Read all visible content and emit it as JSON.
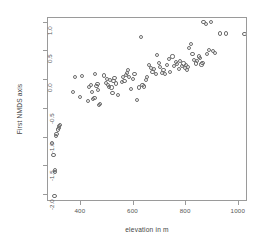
{
  "chart_data": {
    "type": "scatter",
    "title": "",
    "xlabel": "elevation in m",
    "ylabel": "First NMDS axis",
    "xlim": [
      275,
      1035
    ],
    "ylim": [
      -2.12,
      1.08
    ],
    "xticks": [
      400,
      600,
      800,
      1000
    ],
    "yticks": [
      1.0,
      0.5,
      0.0,
      -0.5,
      -1.0,
      -1.5,
      -2.0
    ],
    "xtick_labels": [
      "400",
      "600",
      "800",
      "1000"
    ],
    "ytick_labels": [
      "1.0",
      "0.5",
      "0.0",
      "-0.5",
      "-1.0",
      "-1.5",
      "-2.0"
    ],
    "grid": false,
    "legend": null,
    "marker": "open-circle",
    "marker_color": "#6d6d6d",
    "n_points": 101,
    "points": [
      [
        300,
        -2.01
      ],
      [
        302,
        -1.6
      ],
      [
        303,
        -1.57
      ],
      [
        296,
        -1.3
      ],
      [
        290,
        -1.09
      ],
      [
        305,
        -0.97
      ],
      [
        307,
        -0.94
      ],
      [
        312,
        -0.86
      ],
      [
        316,
        -0.83
      ],
      [
        318,
        -0.8
      ],
      [
        321,
        -0.78
      ],
      [
        370,
        -0.2
      ],
      [
        378,
        0.06
      ],
      [
        396,
        -0.29
      ],
      [
        404,
        0.07
      ],
      [
        428,
        -0.36
      ],
      [
        432,
        -0.12
      ],
      [
        437,
        -0.08
      ],
      [
        441,
        -0.2
      ],
      [
        447,
        -0.33
      ],
      [
        452,
        -0.31
      ],
      [
        455,
        0.11
      ],
      [
        459,
        -0.1
      ],
      [
        463,
        -0.07
      ],
      [
        466,
        -0.17
      ],
      [
        470,
        -0.44
      ],
      [
        474,
        -0.41
      ],
      [
        487,
        0.08
      ],
      [
        496,
        -0.05
      ],
      [
        500,
        0.02
      ],
      [
        504,
        -0.09
      ],
      [
        508,
        -0.12
      ],
      [
        512,
        0.0
      ],
      [
        516,
        -0.13
      ],
      [
        520,
        -0.23
      ],
      [
        524,
        -0.02
      ],
      [
        528,
        0.04
      ],
      [
        533,
        -0.06
      ],
      [
        541,
        -0.26
      ],
      [
        556,
        -0.04
      ],
      [
        560,
        0.05
      ],
      [
        566,
        -0.02
      ],
      [
        571,
        0.09
      ],
      [
        576,
        0.13
      ],
      [
        580,
        0.18
      ],
      [
        584,
        0.05
      ],
      [
        590,
        -0.15
      ],
      [
        597,
        0.02
      ],
      [
        604,
        0.1
      ],
      [
        612,
        -0.35
      ],
      [
        620,
        -0.13
      ],
      [
        628,
        0.75
      ],
      [
        634,
        -0.09
      ],
      [
        640,
        -0.11
      ],
      [
        646,
        0.0
      ],
      [
        652,
        0.06
      ],
      [
        660,
        0.26
      ],
      [
        666,
        0.21
      ],
      [
        672,
        0.14
      ],
      [
        678,
        0.19
      ],
      [
        684,
        0.11
      ],
      [
        690,
        0.44
      ],
      [
        696,
        0.3
      ],
      [
        702,
        0.23
      ],
      [
        708,
        0.13
      ],
      [
        714,
        0.18
      ],
      [
        720,
        0.1
      ],
      [
        728,
        0.26
      ],
      [
        734,
        0.37
      ],
      [
        740,
        0.14
      ],
      [
        748,
        0.41
      ],
      [
        754,
        0.25
      ],
      [
        760,
        0.31
      ],
      [
        766,
        0.28
      ],
      [
        772,
        0.2
      ],
      [
        778,
        0.33
      ],
      [
        784,
        0.24
      ],
      [
        790,
        0.29
      ],
      [
        796,
        0.21
      ],
      [
        800,
        0.26
      ],
      [
        804,
        0.18
      ],
      [
        808,
        0.23
      ],
      [
        812,
        0.56
      ],
      [
        818,
        0.63
      ],
      [
        824,
        0.46
      ],
      [
        830,
        0.35
      ],
      [
        836,
        0.29
      ],
      [
        842,
        0.33
      ],
      [
        848,
        0.41
      ],
      [
        854,
        0.38
      ],
      [
        858,
        0.27
      ],
      [
        862,
        0.3
      ],
      [
        866,
        1.01
      ],
      [
        874,
        0.97
      ],
      [
        880,
        0.46
      ],
      [
        888,
        0.52
      ],
      [
        894,
        1.01
      ],
      [
        902,
        0.5
      ],
      [
        910,
        0.47
      ],
      [
        930,
        0.81
      ],
      [
        952,
        0.81
      ],
      [
        1022,
        0.8
      ]
    ]
  }
}
